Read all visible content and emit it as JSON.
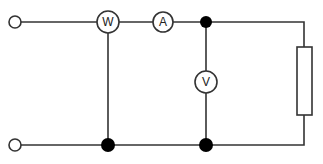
{
  "diagram": {
    "type": "electrical-circuit",
    "meters": [
      {
        "id": "wattmeter",
        "label": "W",
        "cx": 108,
        "cy": 22,
        "r": 11
      },
      {
        "id": "ammeter",
        "label": "A",
        "cx": 163,
        "cy": 22,
        "r": 10
      },
      {
        "id": "voltmeter",
        "label": "V",
        "cx": 206,
        "cy": 82,
        "r": 11
      }
    ],
    "terminals": [
      {
        "id": "input-top",
        "cx": 15,
        "cy": 22,
        "r": 6
      },
      {
        "id": "input-bottom",
        "cx": 15,
        "cy": 145,
        "r": 6
      }
    ],
    "junctions": [
      {
        "id": "top-right-node",
        "cx": 206,
        "cy": 22,
        "r": 6
      },
      {
        "id": "bottom-wattmeter-node",
        "cx": 108,
        "cy": 145,
        "r": 7
      },
      {
        "id": "bottom-voltmeter-node",
        "cx": 206,
        "cy": 145,
        "r": 7
      }
    ],
    "load": {
      "id": "resistor",
      "type": "resistor",
      "x": 297,
      "y": 47,
      "width": 15,
      "height": 68
    },
    "colors": {
      "line": "#333333",
      "junction": "#000000",
      "background": "#ffffff"
    }
  }
}
